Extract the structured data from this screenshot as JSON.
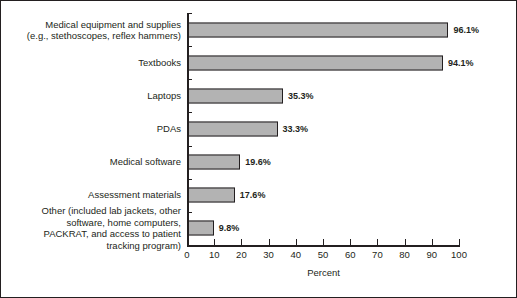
{
  "chart_data": {
    "type": "bar",
    "orientation": "horizontal",
    "title": "",
    "xlabel": "Percent",
    "ylabel": "",
    "xlim": [
      0,
      100
    ],
    "xticks": [
      0,
      10,
      20,
      30,
      40,
      50,
      60,
      70,
      80,
      90,
      100
    ],
    "grid": false,
    "legend": null,
    "bar_color": "#b3b3b3",
    "bar_edge_color": "#231f20",
    "categories": [
      "Medical equipment and supplies\n(e.g., stethoscopes, reflex hammers)",
      "Textbooks",
      "Laptops",
      "PDAs",
      "Medical software",
      "Assessment materials",
      "Other (included lab jackets, other\nsoftware, home computers,\nPACKRAT, and access to patient\ntracking program)"
    ],
    "values": [
      96.1,
      94.1,
      35.3,
      33.3,
      19.6,
      17.6,
      9.8
    ],
    "data_labels": [
      "96.1%",
      "94.1%",
      "35.3%",
      "33.3%",
      "19.6%",
      "17.6%",
      "9.8%"
    ]
  }
}
